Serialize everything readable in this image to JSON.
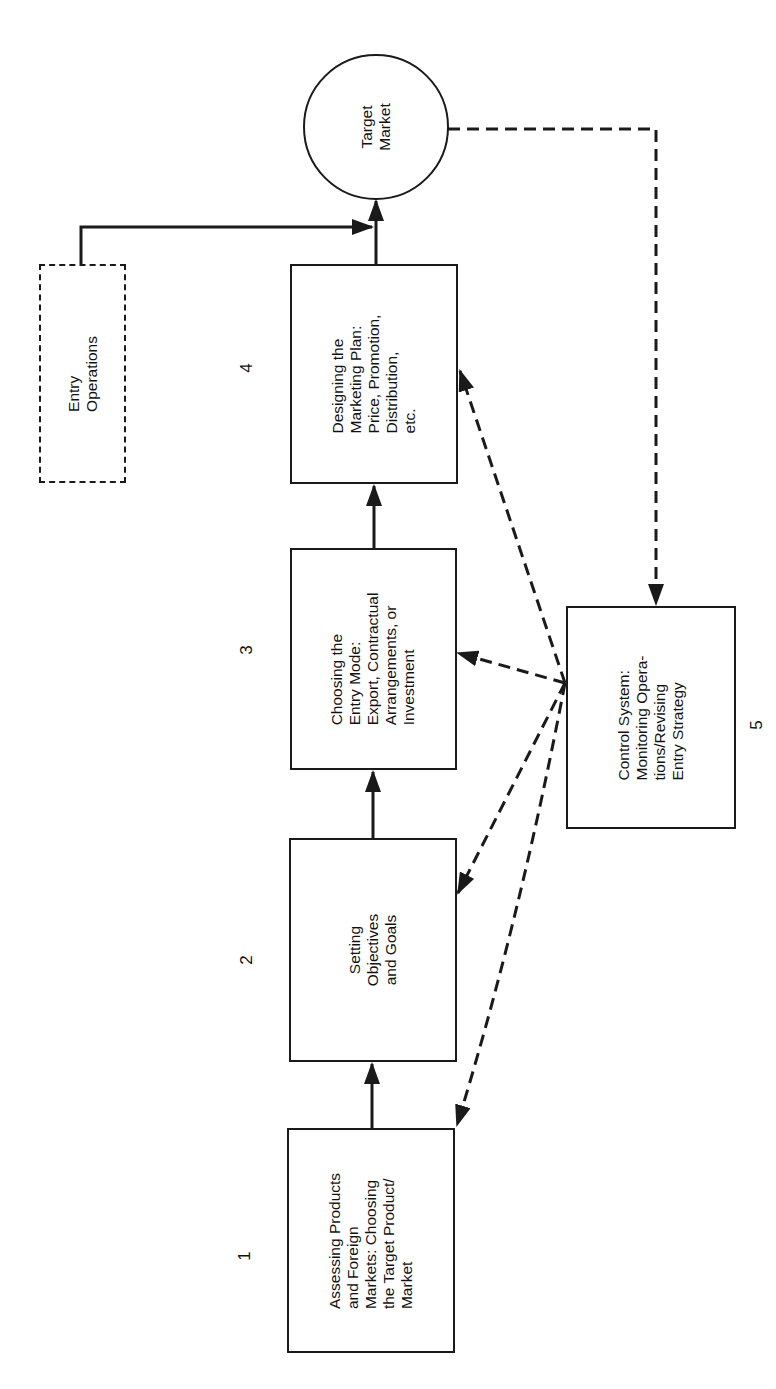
{
  "diagram": {
    "type": "flowchart",
    "orientation": "rotated-90-ccw",
    "nodes": [
      {
        "id": "step1",
        "number": "1",
        "label": "Assessing Products\nand Foreign\nMarkets:  Choosing\nthe Target Product/\nMarket",
        "style": "solid-box"
      },
      {
        "id": "step2",
        "number": "2",
        "label": "Setting\nObjectives\nand Goals",
        "style": "solid-box"
      },
      {
        "id": "step3",
        "number": "3",
        "label": "Choosing the\nEntry Mode:\nExport, Contractual\nArrangements, or\nInvestment",
        "style": "solid-box"
      },
      {
        "id": "step4",
        "number": "4",
        "label": "Designing the\nMarketing Plan:\nPrice, Promotion,\nDistribution,\netc.",
        "style": "solid-box"
      },
      {
        "id": "step5",
        "number": "5",
        "label": "Control System:\nMonitoring Opera-\ntions/Revising\nEntry Strategy",
        "style": "solid-box"
      },
      {
        "id": "entry_ops",
        "label": "Entry\nOperations",
        "style": "dashed-box"
      },
      {
        "id": "target_market",
        "label": "Target\nMarket",
        "style": "circle"
      }
    ],
    "edges": [
      {
        "from": "step1",
        "to": "step2",
        "style": "solid"
      },
      {
        "from": "step2",
        "to": "step3",
        "style": "solid"
      },
      {
        "from": "step3",
        "to": "step4",
        "style": "solid"
      },
      {
        "from": "step4",
        "to": "target_market",
        "style": "solid"
      },
      {
        "from": "entry_ops",
        "to": "target_market",
        "style": "solid"
      },
      {
        "from": "target_market",
        "to": "step5",
        "style": "dashed"
      },
      {
        "from": "step5",
        "to": "step1",
        "style": "dashed"
      },
      {
        "from": "step5",
        "to": "step2",
        "style": "dashed"
      },
      {
        "from": "step5",
        "to": "step3",
        "style": "dashed"
      },
      {
        "from": "step5",
        "to": "step4",
        "style": "dashed"
      }
    ],
    "colors": {
      "stroke": "#1a1a1a",
      "background": "#ffffff"
    }
  }
}
